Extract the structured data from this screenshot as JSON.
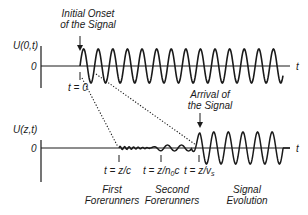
{
  "top_panel": {
    "y_axis_label": "U(0,t)",
    "zero_label": "0",
    "t_axis_label": "t",
    "annotation_line1": "Initial Onset",
    "annotation_line2": "of the Signal",
    "time_marker": "t = 0"
  },
  "bottom_panel": {
    "y_axis_label": "U(z,t)",
    "zero_label": "0",
    "t_axis_label": "t",
    "arrival_line1": "Arrival of",
    "arrival_line2": "the Signal",
    "markers": [
      {
        "text_main": "t = z/c",
        "sub": ""
      },
      {
        "text_main": "t = z/n",
        "sub": "0",
        "tail": "c"
      },
      {
        "text_main": "t = z/v",
        "sub": "s"
      }
    ],
    "regions": [
      {
        "line1": "First",
        "line2": "Forerunners"
      },
      {
        "line1": "Second",
        "line2": "Forerunners"
      },
      {
        "line1": "Signal",
        "line2": "Evolution"
      }
    ]
  },
  "colors": {
    "ink": "#1a1a1a",
    "background": "#ffffff"
  }
}
